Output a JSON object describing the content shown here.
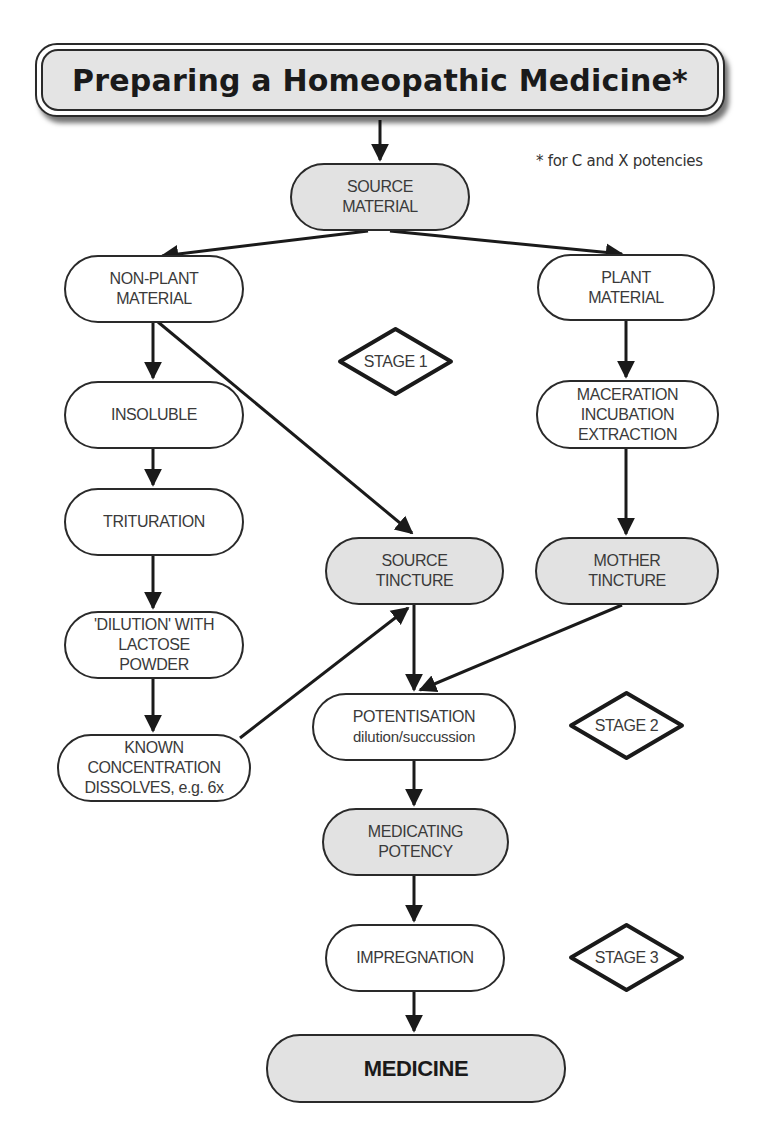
{
  "title": "Preparing a Homeopathic Medicine*",
  "footnote": "* for C and X potencies",
  "colors": {
    "stroke": "#2a2a2a",
    "shaded_fill": "#e2e2e2",
    "plain_fill": "#ffffff",
    "title_fill": "#e4e4e4"
  },
  "nodes": {
    "source_material": {
      "lines": [
        "SOURCE",
        "MATERIAL"
      ],
      "shaded": true
    },
    "non_plant_material": {
      "lines": [
        "NON-PLANT",
        "MATERIAL"
      ],
      "shaded": false
    },
    "plant_material": {
      "lines": [
        "PLANT",
        "MATERIAL"
      ],
      "shaded": false
    },
    "insoluble": {
      "lines": [
        "INSOLUBLE"
      ],
      "shaded": false
    },
    "maceration": {
      "lines": [
        "MACERATION",
        "INCUBATION",
        "EXTRACTION"
      ],
      "shaded": false
    },
    "trituration": {
      "lines": [
        "TRITURATION"
      ],
      "shaded": false
    },
    "source_tincture": {
      "lines": [
        "SOURCE",
        "TINCTURE"
      ],
      "shaded": true
    },
    "mother_tincture": {
      "lines": [
        "MOTHER",
        "TINCTURE"
      ],
      "shaded": true
    },
    "dilution_lactose": {
      "lines": [
        "'DILUTION' WITH",
        "LACTOSE",
        "POWDER"
      ],
      "shaded": false
    },
    "potentisation": {
      "lines": [
        "POTENTISATION",
        "dilution/succussion"
      ],
      "shaded": false
    },
    "known_concentration": {
      "lines": [
        "KNOWN",
        "CONCENTRATION",
        "DISSOLVES, e.g. 6x"
      ],
      "shaded": false
    },
    "medicating_potency": {
      "lines": [
        "MEDICATING",
        "POTENCY"
      ],
      "shaded": true
    },
    "impregnation": {
      "lines": [
        "IMPREGNATION"
      ],
      "shaded": false
    },
    "medicine": {
      "lines": [
        "MEDICINE"
      ],
      "shaded": true
    }
  },
  "stages": {
    "stage1": "STAGE 1",
    "stage2": "STAGE 2",
    "stage3": "STAGE 3"
  },
  "edges": [
    {
      "from": "title",
      "to": "source_material"
    },
    {
      "from": "source_material",
      "to": "non_plant_material"
    },
    {
      "from": "source_material",
      "to": "plant_material"
    },
    {
      "from": "non_plant_material",
      "to": "insoluble"
    },
    {
      "from": "non_plant_material",
      "to": "source_tincture"
    },
    {
      "from": "plant_material",
      "to": "maceration"
    },
    {
      "from": "insoluble",
      "to": "trituration"
    },
    {
      "from": "maceration",
      "to": "mother_tincture"
    },
    {
      "from": "trituration",
      "to": "dilution_lactose"
    },
    {
      "from": "dilution_lactose",
      "to": "known_concentration"
    },
    {
      "from": "known_concentration",
      "to": "source_tincture"
    },
    {
      "from": "source_tincture",
      "to": "potentisation"
    },
    {
      "from": "mother_tincture",
      "to": "potentisation"
    },
    {
      "from": "potentisation",
      "to": "medicating_potency"
    },
    {
      "from": "medicating_potency",
      "to": "impregnation"
    },
    {
      "from": "impregnation",
      "to": "medicine"
    }
  ]
}
